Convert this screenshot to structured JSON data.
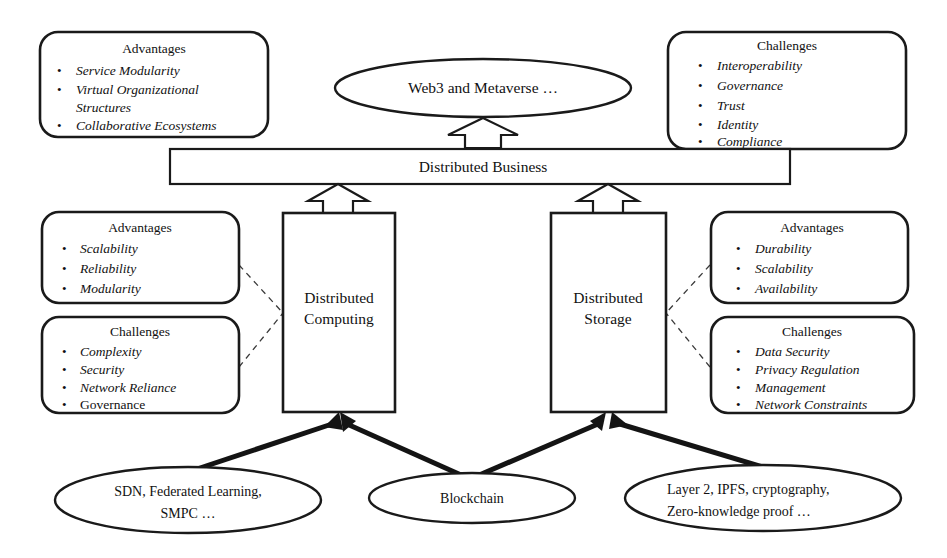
{
  "diagram": {
    "colors": {
      "background": "#ffffff",
      "stroke": "#1a1a1a",
      "text": "#111111",
      "dashed": "#3a3a3a",
      "solid_arrow": "#141414"
    },
    "top_vision": {
      "label": "Web3 and Metaverse …"
    },
    "bar": {
      "label": "Distributed Business"
    },
    "nodes": {
      "computing": {
        "line1": "Distributed",
        "line2": "Computing"
      },
      "storage": {
        "line1": "Distributed",
        "line2": "Storage"
      }
    },
    "callouts": {
      "top_left": {
        "heading": "Advantages",
        "bullet": "•",
        "items": [
          {
            "text": "Service Modularity",
            "italic": true
          },
          {
            "text": "Virtual Organizational",
            "italic": true
          },
          {
            "text": "Structures",
            "italic": true,
            "continuation": true
          },
          {
            "text": "Collaborative Ecosystems",
            "italic": true
          }
        ]
      },
      "top_right": {
        "heading": "Challenges",
        "bullet": "•",
        "items": [
          {
            "text": "Interoperability",
            "italic": true
          },
          {
            "text": "Governance",
            "italic": true
          },
          {
            "text": "Trust",
            "italic": true
          },
          {
            "text": "Identity",
            "italic": true
          },
          {
            "text": "Compliance",
            "italic": true
          }
        ]
      },
      "mid_left_advantages": {
        "heading": "Advantages",
        "bullet": "•",
        "items": [
          {
            "text": "Scalability",
            "italic": true
          },
          {
            "text": "Reliability",
            "italic": true
          },
          {
            "text": "Modularity",
            "italic": true
          }
        ]
      },
      "mid_left_challenges": {
        "heading": "Challenges",
        "bullet": "•",
        "items": [
          {
            "text": "Complexity",
            "italic": true
          },
          {
            "text": "Security",
            "italic": true
          },
          {
            "text": "Network Reliance",
            "italic": true
          },
          {
            "text": "Governance",
            "italic": false
          }
        ]
      },
      "mid_right_advantages": {
        "heading": "Advantages",
        "bullet": "•",
        "items": [
          {
            "text": "Durability",
            "italic": true
          },
          {
            "text": "Scalability",
            "italic": true
          },
          {
            "text": "Availability",
            "italic": true
          }
        ]
      },
      "mid_right_challenges": {
        "heading": "Challenges",
        "bullet": "•",
        "items": [
          {
            "text": "Data Security",
            "italic": true
          },
          {
            "text": "Privacy Regulation",
            "italic": true
          },
          {
            "text": "Management",
            "italic": true
          },
          {
            "text": "Network Constraints",
            "italic": true
          }
        ]
      }
    },
    "enablers": {
      "left": {
        "line1": "SDN, Federated Learning,",
        "line2": "SMPC …"
      },
      "center": {
        "line1": "Blockchain"
      },
      "right": {
        "line1": "Layer 2, IPFS, cryptography,",
        "line2": "Zero-knowledge  proof …"
      }
    }
  }
}
